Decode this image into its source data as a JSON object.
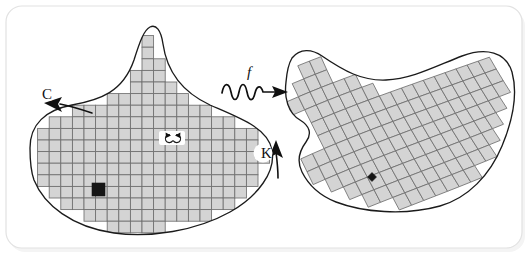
{
  "figure": {
    "background_color": "#ffffff",
    "frame": {
      "stroke_color": "#e2e2e2",
      "corner_radius": 16,
      "x": 6,
      "y": 6,
      "width": 516,
      "height": 242
    },
    "style": {
      "cell_fill": "#d4d4d4",
      "cell_stroke": "#6f6f6f",
      "outline_stroke": "#1b1b1b",
      "marked_cell_fill": "#161616",
      "label_color": "#111111"
    }
  },
  "labels": {
    "curve_label": "C",
    "compact_label": "K",
    "map_label": "f",
    "rotation_cw": "rotate-clockwise",
    "rotation_ccw": "rotate-counterclockwise"
  },
  "annotations": {
    "curve_arrow": "arrow-along-boundary-pointing-down-left",
    "compact_arrow": "arrow-pointing-up-at-boundary",
    "map_arrow": "wavy-arrow-pointing-right"
  },
  "domains": [
    {
      "name": "source-domain",
      "mesh_type": "axis-aligned-square-grid",
      "cell_size": 11.6,
      "marked_cell": {
        "x": 92,
        "y": 183,
        "w": 13,
        "h": 13
      },
      "outline_path": "M 30 148 C 30 124 46 110 72 105 C 100 100 123 92 134 60 C 140 41 144 30 150 27 C 156 24 161 30 163 44 C 167 72 182 92 210 105 C 240 118 268 128 272 150 C 276 172 258 196 230 212 C 196 231 150 238 114 233 C 72 227 44 205 34 180 C 30 169 30 158 30 148 Z"
    },
    {
      "name": "target-domain",
      "mesh_type": "deformed-quadrilateral-mesh",
      "marked_cell": {
        "cx": 372,
        "cy": 177,
        "size": 9
      },
      "outline_path": "M 292 58 C 300 48 312 49 322 56 C 344 71 362 81 386 80 C 412 79 436 66 462 56 C 486 47 506 52 512 72 C 518 94 512 122 502 146 C 490 175 468 198 440 206 C 404 216 362 212 336 202 C 318 195 308 184 302 172 C 296 160 300 150 306 142 C 312 134 310 126 300 120 C 288 113 284 98 286 82 C 287 70 289 63 292 58 Z"
    }
  ],
  "label_positions": {
    "C": {
      "x": 42,
      "y": 99
    },
    "K": {
      "x": 261,
      "y": 158
    },
    "f": {
      "x": 247,
      "y": 77
    }
  }
}
